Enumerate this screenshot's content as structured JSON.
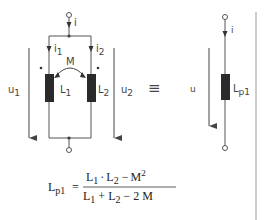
{
  "diagram": {
    "left_circuit": {
      "current_total": "i",
      "current_branch_1": {
        "main": "i",
        "sub": "1"
      },
      "current_branch_2": {
        "main": "i",
        "sub": "2"
      },
      "mutual_label": "M",
      "inductor_1": {
        "main": "L",
        "sub": "1"
      },
      "inductor_2": {
        "main": "L",
        "sub": "2"
      },
      "voltage_1": {
        "main": "u",
        "sub": "1"
      },
      "voltage_2": {
        "main": "u",
        "sub": "2"
      },
      "dot_marker": "•"
    },
    "equivalence_symbol": "≡",
    "right_circuit": {
      "current": "i",
      "voltage": "u",
      "inductor": {
        "main": "L",
        "sub": "p1"
      }
    },
    "formula": {
      "lhs": {
        "main": "L",
        "sub": "p1"
      },
      "equals": "=",
      "numerator": {
        "a": "L",
        "a_sub": "1",
        "dot": "·",
        "b": "L",
        "b_sub": "2",
        "minus": "−",
        "c": "M",
        "c_sup": "2"
      },
      "denominator": {
        "a": "L",
        "a_sub": "1",
        "plus": "+",
        "b": "L",
        "b_sub": "2",
        "minus": "−",
        "c": "2 M"
      }
    },
    "colors": {
      "wire": "#555555",
      "inductor_fill": "#2a2a2a",
      "text": "#444444",
      "divider": "#999999"
    }
  }
}
